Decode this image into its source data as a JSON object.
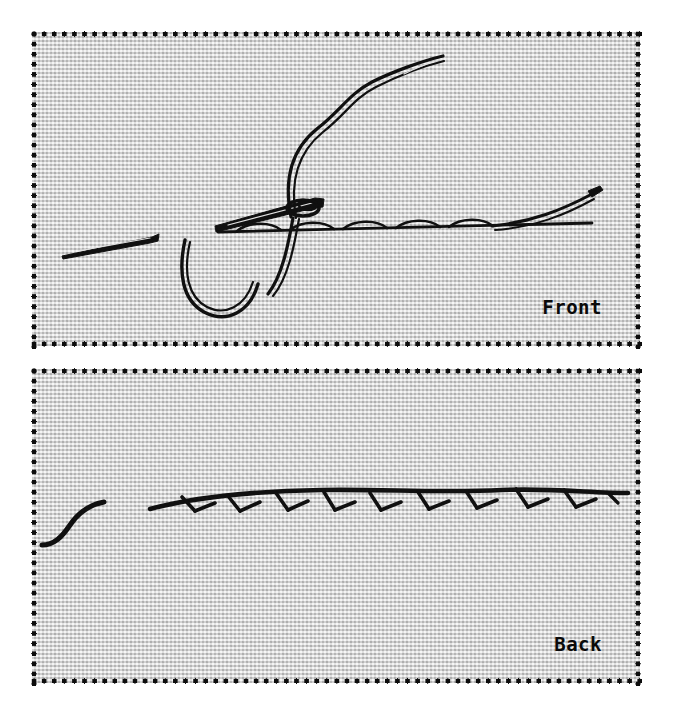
{
  "figure": {
    "background_color": "#ffffff",
    "fabric_color": "#d9d9d9",
    "ink_color": "#101010",
    "border_style": "dotted"
  },
  "panels": [
    {
      "id": "front",
      "label": "Front",
      "label_position": "bottom-right",
      "caption_font": "bold monospace",
      "elements": [
        {
          "name": "needle-tip",
          "description": "tapered sewing needle point at lower left"
        },
        {
          "name": "needle-body",
          "description": "needle shaft piercing the fabric"
        },
        {
          "name": "thread-loop",
          "description": "large loop of thread hanging below the needle"
        },
        {
          "name": "thread-tail-upper",
          "description": "double-strand thread rising to upper right"
        },
        {
          "name": "stitch-line",
          "description": "row of running stitches across the fabric"
        },
        {
          "name": "thread-tail-right",
          "description": "thread end rising to the right edge"
        }
      ]
    },
    {
      "id": "back",
      "label": "Back",
      "label_position": "bottom-right",
      "caption_font": "bold monospace",
      "elements": [
        {
          "name": "thread-tail-left",
          "description": "short thread tail on the left"
        },
        {
          "name": "stitch-line-back",
          "description": "row of stitches with small V shaped crossings"
        }
      ]
    }
  ],
  "border": {
    "dot_diameter_px": 5,
    "dot_spacing_px": 10,
    "dot_color": "#0d0d0d"
  }
}
